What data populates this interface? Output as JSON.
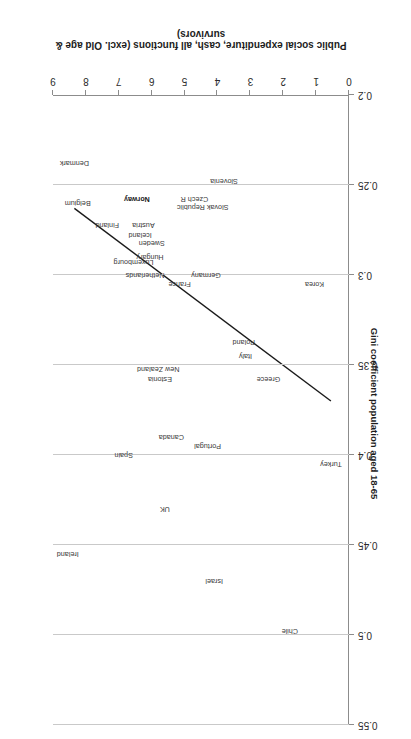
{
  "chart_data": {
    "type": "scatter",
    "title": "",
    "xlabel": "Public social expenditure, cash, all functions (excl. Old age & survivors)",
    "ylabel": "Gini coefficient population aged 18-65",
    "xlim": [
      0,
      9
    ],
    "ylim": [
      0.2,
      0.55
    ],
    "xticks": [
      "0",
      "1",
      "2",
      "3",
      "4",
      "5",
      "6",
      "7",
      "8",
      "9"
    ],
    "yticks": [
      "0.2",
      "0.25",
      "0.3",
      "0.35",
      "0.4",
      "0.45",
      "0.5",
      "0.55"
    ],
    "grid": "horizontal",
    "legend": "none",
    "point_color": "#3a3a3a",
    "trendline_color": "#1a1a1a",
    "points": [
      {
        "label": "Turkey",
        "x": 0.55,
        "y": 0.405
      },
      {
        "label": "Korea",
        "x": 1.05,
        "y": 0.305
      },
      {
        "label": "Chile",
        "x": 1.8,
        "y": 0.498
      },
      {
        "label": "Greece",
        "x": 2.45,
        "y": 0.358
      },
      {
        "label": "Italy",
        "x": 3.15,
        "y": 0.345
      },
      {
        "label": "Poland",
        "x": 3.2,
        "y": 0.337
      },
      {
        "label": "Slovenia",
        "x": 3.8,
        "y": 0.248
      },
      {
        "label": "Israel",
        "x": 4.1,
        "y": 0.47
      },
      {
        "label": "Portugal",
        "x": 4.3,
        "y": 0.395
      },
      {
        "label": "Germany",
        "x": 4.35,
        "y": 0.3
      },
      {
        "label": "Slovak Republic",
        "x": 4.45,
        "y": 0.262
      },
      {
        "label": "Czech R",
        "x": 4.7,
        "y": 0.258
      },
      {
        "label": "France",
        "x": 5.15,
        "y": 0.305
      },
      {
        "label": "Canada",
        "x": 5.4,
        "y": 0.39
      },
      {
        "label": "UK",
        "x": 5.6,
        "y": 0.43
      },
      {
        "label": "Estonia",
        "x": 5.75,
        "y": 0.358
      },
      {
        "label": "New Zealand",
        "x": 5.8,
        "y": 0.352
      },
      {
        "label": "Hungary",
        "x": 6.05,
        "y": 0.29
      },
      {
        "label": "Netherlands",
        "x": 6.2,
        "y": 0.3
      },
      {
        "label": "Austria",
        "x": 6.25,
        "y": 0.272
      },
      {
        "label": "Sweden",
        "x": 6.0,
        "y": 0.282
      },
      {
        "label": "Iceland",
        "x": 6.35,
        "y": 0.278
      },
      {
        "label": "Norway",
        "x": 6.45,
        "y": 0.258
      },
      {
        "label": "Luxembourg",
        "x": 6.55,
        "y": 0.293
      },
      {
        "label": "Spain",
        "x": 6.85,
        "y": 0.4
      },
      {
        "label": "Finland",
        "x": 7.35,
        "y": 0.272
      },
      {
        "label": "Belgium",
        "x": 8.25,
        "y": 0.26
      },
      {
        "label": "Denmark",
        "x": 8.35,
        "y": 0.238
      },
      {
        "label": "Ireland",
        "x": 8.55,
        "y": 0.455
      }
    ],
    "bold_points": [
      "Norway"
    ],
    "trendline": {
      "x0": 0.55,
      "y0": 0.37,
      "x1": 8.35,
      "y1": 0.263
    }
  }
}
